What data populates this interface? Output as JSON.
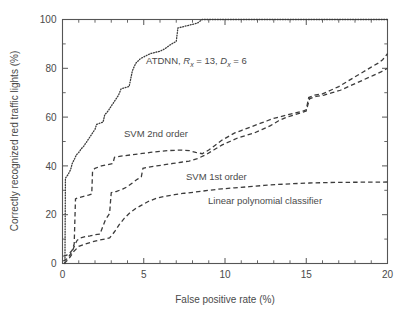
{
  "chart_data": {
    "type": "line",
    "title": "",
    "xlabel": "False positive rate (%)",
    "ylabel": "Correctly recognized red traffic lights (%)",
    "xlim": [
      0,
      20
    ],
    "ylim": [
      0,
      100
    ],
    "xticks": [
      0,
      5,
      10,
      15,
      20
    ],
    "xtick_labels": [
      "0",
      "5",
      "10",
      "15",
      "20"
    ],
    "xminor_step": 1,
    "yticks": [
      0,
      20,
      40,
      60,
      80,
      100
    ],
    "ytick_labels": [
      "0",
      "20",
      "40",
      "60",
      "80",
      "100"
    ],
    "yminor_step": 10,
    "grid": false,
    "legend_position": "inline-annotations",
    "series": [
      {
        "name": "ATDNN, Rx = 13, Dx = 6",
        "label_plain": "ATDNN, R_x = 13, D_x = 6",
        "style": "dotted",
        "color": "#3c3c3c",
        "points": [
          [
            0.15,
            0.0
          ],
          [
            0.18,
            35.0
          ],
          [
            0.35,
            36.5
          ],
          [
            0.5,
            38.5
          ],
          [
            0.6,
            41.0
          ],
          [
            0.75,
            43.0
          ],
          [
            0.85,
            44.5
          ],
          [
            1.0,
            45.5
          ],
          [
            1.15,
            47.0
          ],
          [
            1.3,
            48.0
          ],
          [
            1.45,
            49.5
          ],
          [
            1.6,
            51.0
          ],
          [
            1.75,
            52.5
          ],
          [
            1.9,
            54.0
          ],
          [
            2.0,
            55.0
          ],
          [
            2.1,
            57.0
          ],
          [
            2.3,
            57.5
          ],
          [
            2.5,
            58.0
          ],
          [
            2.6,
            61.0
          ],
          [
            2.75,
            62.0
          ],
          [
            2.9,
            63.5
          ],
          [
            3.0,
            64.5
          ],
          [
            3.15,
            66.0
          ],
          [
            3.3,
            67.5
          ],
          [
            3.45,
            69.0
          ],
          [
            3.6,
            71.5
          ],
          [
            3.8,
            72.0
          ],
          [
            4.1,
            72.5
          ],
          [
            4.3,
            79.0
          ],
          [
            4.5,
            82.0
          ],
          [
            4.8,
            84.0
          ],
          [
            5.1,
            85.0
          ],
          [
            5.4,
            86.0
          ],
          [
            5.7,
            86.5
          ],
          [
            6.0,
            87.0
          ],
          [
            6.3,
            88.0
          ],
          [
            6.6,
            89.5
          ],
          [
            6.85,
            90.5
          ],
          [
            7.0,
            91.0
          ],
          [
            7.1,
            96.5
          ],
          [
            7.4,
            97.0
          ],
          [
            7.7,
            97.5
          ],
          [
            8.0,
            98.0
          ],
          [
            8.3,
            98.5
          ],
          [
            8.6,
            100.0
          ],
          [
            20.0,
            100.0
          ]
        ]
      },
      {
        "name": "SVM 2nd order",
        "label_plain": "SVM 2nd order",
        "style": "dashed",
        "color": "#3c3c3c",
        "points": [
          [
            0.05,
            3.0
          ],
          [
            0.2,
            3.2
          ],
          [
            0.4,
            4.0
          ],
          [
            0.6,
            5.5
          ],
          [
            0.72,
            8.0
          ],
          [
            0.8,
            26.5
          ],
          [
            1.0,
            27.0
          ],
          [
            1.3,
            27.5
          ],
          [
            1.6,
            28.0
          ],
          [
            1.8,
            28.5
          ],
          [
            1.85,
            38.0
          ],
          [
            2.0,
            39.0
          ],
          [
            2.4,
            40.0
          ],
          [
            2.8,
            40.5
          ],
          [
            3.1,
            41.0
          ],
          [
            3.2,
            43.5
          ],
          [
            3.6,
            44.0
          ],
          [
            4.2,
            44.5
          ],
          [
            4.8,
            45.0
          ],
          [
            5.4,
            45.5
          ],
          [
            6.0,
            46.0
          ],
          [
            6.6,
            46.3
          ],
          [
            7.2,
            46.5
          ],
          [
            7.8,
            46.3
          ],
          [
            8.2,
            45.5
          ],
          [
            8.6,
            45.0
          ],
          [
            9.0,
            46.5
          ],
          [
            9.4,
            48.5
          ],
          [
            9.8,
            50.5
          ],
          [
            10.2,
            52.0
          ],
          [
            10.6,
            53.5
          ],
          [
            11.0,
            54.5
          ],
          [
            11.4,
            55.5
          ],
          [
            11.8,
            56.5
          ],
          [
            12.2,
            57.5
          ],
          [
            12.6,
            58.5
          ],
          [
            13.0,
            59.5
          ],
          [
            13.6,
            60.5
          ],
          [
            14.2,
            61.5
          ],
          [
            14.8,
            62.5
          ],
          [
            15.0,
            63.0
          ],
          [
            15.15,
            68.0
          ],
          [
            15.5,
            69.0
          ],
          [
            16.0,
            69.5
          ],
          [
            16.5,
            71.0
          ],
          [
            17.0,
            72.5
          ],
          [
            17.5,
            74.5
          ],
          [
            18.0,
            76.5
          ],
          [
            18.5,
            78.5
          ],
          [
            19.0,
            80.5
          ],
          [
            19.4,
            82.0
          ],
          [
            19.7,
            83.5
          ],
          [
            20.0,
            86.0
          ]
        ]
      },
      {
        "name": "SVM 1st order",
        "label_plain": "SVM 1st order",
        "style": "dashed",
        "color": "#3c3c3c",
        "points": [
          [
            0.05,
            1.0
          ],
          [
            0.3,
            2.0
          ],
          [
            0.6,
            5.0
          ],
          [
            0.75,
            7.5
          ],
          [
            0.9,
            9.5
          ],
          [
            1.1,
            10.5
          ],
          [
            1.4,
            11.0
          ],
          [
            1.7,
            11.3
          ],
          [
            2.0,
            11.8
          ],
          [
            2.3,
            12.0
          ],
          [
            2.5,
            15.5
          ],
          [
            2.65,
            18.0
          ],
          [
            2.8,
            19.5
          ],
          [
            2.9,
            20.5
          ],
          [
            2.95,
            25.0
          ],
          [
            3.0,
            29.0
          ],
          [
            3.3,
            29.5
          ],
          [
            3.7,
            30.5
          ],
          [
            4.0,
            31.5
          ],
          [
            4.3,
            33.0
          ],
          [
            4.6,
            34.5
          ],
          [
            4.85,
            35.5
          ],
          [
            4.95,
            39.0
          ],
          [
            5.3,
            39.5
          ],
          [
            5.8,
            40.0
          ],
          [
            6.3,
            40.5
          ],
          [
            6.8,
            41.0
          ],
          [
            7.3,
            41.5
          ],
          [
            7.8,
            42.0
          ],
          [
            8.3,
            43.0
          ],
          [
            8.8,
            44.5
          ],
          [
            9.3,
            46.5
          ],
          [
            9.8,
            48.5
          ],
          [
            10.3,
            50.0
          ],
          [
            10.8,
            51.5
          ],
          [
            11.3,
            52.5
          ],
          [
            11.8,
            53.5
          ],
          [
            12.3,
            55.0
          ],
          [
            12.8,
            56.5
          ],
          [
            13.3,
            58.5
          ],
          [
            13.8,
            60.0
          ],
          [
            14.3,
            61.0
          ],
          [
            14.8,
            62.0
          ],
          [
            15.0,
            62.5
          ],
          [
            15.2,
            67.5
          ],
          [
            15.6,
            68.5
          ],
          [
            16.1,
            69.0
          ],
          [
            16.6,
            70.0
          ],
          [
            17.1,
            71.0
          ],
          [
            17.6,
            72.5
          ],
          [
            18.1,
            74.0
          ],
          [
            18.6,
            75.5
          ],
          [
            19.1,
            77.0
          ],
          [
            19.6,
            78.5
          ],
          [
            20.0,
            80.0
          ]
        ]
      },
      {
        "name": "Linear polynomial classifier",
        "label_plain": "Linear polynomial classifier",
        "style": "dashed",
        "color": "#3c3c3c",
        "points": [
          [
            0.1,
            0.0
          ],
          [
            0.4,
            2.0
          ],
          [
            0.7,
            5.0
          ],
          [
            1.0,
            7.0
          ],
          [
            1.4,
            8.0
          ],
          [
            1.8,
            8.8
          ],
          [
            2.2,
            9.5
          ],
          [
            2.6,
            10.0
          ],
          [
            2.9,
            10.5
          ],
          [
            3.2,
            13.0
          ],
          [
            3.5,
            16.0
          ],
          [
            3.8,
            18.5
          ],
          [
            4.1,
            20.5
          ],
          [
            4.5,
            22.5
          ],
          [
            4.9,
            24.0
          ],
          [
            5.3,
            25.5
          ],
          [
            5.8,
            26.8
          ],
          [
            6.3,
            27.5
          ],
          [
            6.9,
            28.2
          ],
          [
            7.5,
            28.8
          ],
          [
            8.2,
            29.3
          ],
          [
            9.0,
            30.0
          ],
          [
            9.8,
            30.6
          ],
          [
            10.6,
            31.0
          ],
          [
            11.5,
            31.5
          ],
          [
            12.4,
            32.0
          ],
          [
            13.3,
            32.4
          ],
          [
            14.2,
            32.7
          ],
          [
            15.2,
            33.0
          ],
          [
            16.5,
            33.2
          ],
          [
            18.0,
            33.3
          ],
          [
            20.0,
            33.4
          ]
        ]
      }
    ],
    "annotations": [
      {
        "id": "atdnn",
        "text": "ATDNN, R_x = 13, D_x = 6",
        "x_px": 146,
        "y_px": 61
      },
      {
        "id": "svm2",
        "text": "SVM 2nd order",
        "x_px": 124,
        "y_px": 134
      },
      {
        "id": "svm1",
        "text": "SVM 1st order",
        "x_px": 186,
        "y_px": 177
      },
      {
        "id": "linear",
        "text": "Linear polynomial classifier",
        "x_px": 208,
        "y_px": 201
      }
    ]
  },
  "labels": {
    "xaxis_title": "False positive rate (%)",
    "yaxis_title": "Correctly recognized red traffic lights (%)",
    "atdnn_prefix": "ATDNN, ",
    "atdnn_R": "R",
    "atdnn_sub_x1": "x",
    "atdnn_eq13": " = 13, ",
    "atdnn_D": "D",
    "atdnn_sub_x2": "x",
    "atdnn_eq6": " = 6",
    "svm2": "SVM 2nd order",
    "svm1": "SVM 1st order",
    "linear": "Linear polynomial classifier"
  },
  "ticks": {
    "x": [
      "0",
      "5",
      "10",
      "15",
      "20"
    ],
    "y": [
      "0",
      "20",
      "40",
      "60",
      "80",
      "100"
    ]
  },
  "colors": {
    "axis": "#555555",
    "curve": "#3c3c3c",
    "text": "#4a4a4a",
    "background": "#ffffff"
  }
}
